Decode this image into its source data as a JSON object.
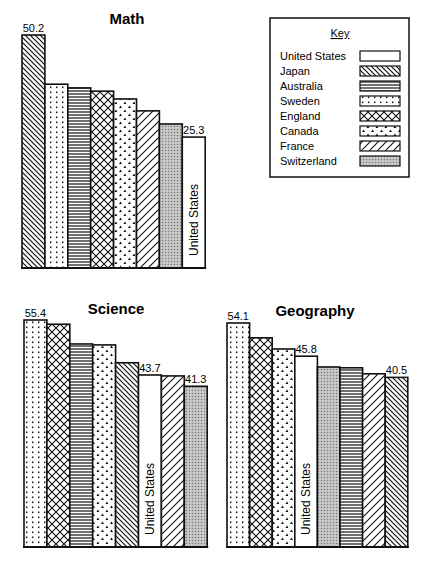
{
  "key": {
    "title": "Key",
    "items": [
      {
        "name": "United States",
        "pattern": "blank"
      },
      {
        "name": "Japan",
        "pattern": "diag-back"
      },
      {
        "name": "Australia",
        "pattern": "horizontal"
      },
      {
        "name": "Sweden",
        "pattern": "dots"
      },
      {
        "name": "England",
        "pattern": "crosshatch"
      },
      {
        "name": "Canada",
        "pattern": "triangles"
      },
      {
        "name": "France",
        "pattern": "diag-fwd"
      },
      {
        "name": "Switzerland",
        "pattern": "stipple"
      }
    ]
  },
  "chart_data": [
    {
      "type": "bar",
      "title": "Math",
      "categories": [
        "Japan",
        "Sweden",
        "Australia",
        "England",
        "Canada",
        "France",
        "Switzerland",
        "United States"
      ],
      "values": [
        50.2,
        38.2,
        37.3,
        36.5,
        34.6,
        31.7,
        28.5,
        25.3
      ],
      "labeled_values": {
        "Japan": "50.2",
        "United States": "25.3"
      },
      "bar_text": {
        "United States": "United States"
      },
      "xlabel": "",
      "ylabel": "",
      "grid": false,
      "legend_position": "top-right box"
    },
    {
      "type": "bar",
      "title": "Science",
      "categories": [
        "Sweden",
        "England",
        "Australia",
        "Canada",
        "Japan",
        "United States",
        "France",
        "Switzerland"
      ],
      "values": [
        55.4,
        54.5,
        50.3,
        50.1,
        46.3,
        43.7,
        43.5,
        41.3
      ],
      "labeled_values": {
        "Sweden": "55.4",
        "United States": "43.7",
        "Switzerland": "41.3"
      },
      "bar_text": {
        "United States": "United States"
      },
      "xlabel": "",
      "ylabel": "",
      "grid": false
    },
    {
      "type": "bar",
      "title": "Geography",
      "categories": [
        "Sweden",
        "England",
        "Canada",
        "United States",
        "Switzerland",
        "Australia",
        "France",
        "Japan"
      ],
      "values": [
        54.1,
        50.4,
        47.6,
        45.8,
        43.1,
        42.9,
        41.4,
        40.5
      ],
      "labeled_values": {
        "Sweden": "54.1",
        "United States": "45.8",
        "Japan": "40.5"
      },
      "bar_text": {
        "United States": "United States"
      },
      "xlabel": "",
      "ylabel": "",
      "grid": false
    }
  ],
  "charts_layout": [
    {
      "x0": 22,
      "barw": 22.9,
      "base": 268,
      "ref_val": 50.2,
      "ref_top": 35,
      "pxu": 4.1
    },
    {
      "x0": 24,
      "barw": 22.9,
      "base": 547,
      "ref_val": 55.4,
      "ref_top": 320,
      "pxu": 4.7
    },
    {
      "x0": 227,
      "barw": 22.6,
      "base": 547,
      "ref_val": 54.1,
      "ref_top": 323,
      "pxu": 4.0
    }
  ]
}
